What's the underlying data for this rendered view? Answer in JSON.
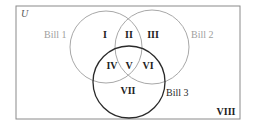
{
  "diagram": {
    "universe_label": "U",
    "sets": [
      {
        "name": "Bill 1",
        "color": "#a0a0a0"
      },
      {
        "name": "Bill 2",
        "color": "#a0a0a0"
      },
      {
        "name": "Bill 3",
        "color": "#2a2a2a"
      }
    ],
    "regions": {
      "r1": "I",
      "r2": "II",
      "r3": "III",
      "r4": "IV",
      "r5": "V",
      "r6": "VI",
      "r7": "VII",
      "r8": "VIII"
    }
  }
}
